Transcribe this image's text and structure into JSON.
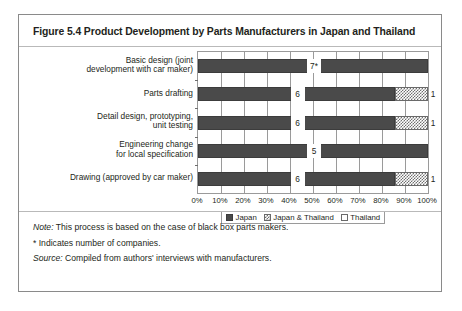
{
  "figure": {
    "title": "Figure 5.4 Product Development by Parts Manufacturers in Japan and Thailand"
  },
  "notes": {
    "note_label": "Note:",
    "note_text": " This process is based on the case of black box parts makers.",
    "asterisk_line": "* Indicates number of companies.",
    "source_label": "Source:",
    "source_text": " Compiled from authors' interviews with manufacturers."
  },
  "colors": {
    "japan": "#4a4a4a",
    "both": "#6f6f6f",
    "thailand": "#ffffff",
    "frame": "#8a8a8a",
    "grid": "#9a9a9a"
  },
  "chart_data": {
    "type": "bar",
    "orientation": "horizontal",
    "stacked": true,
    "stacked_percent": true,
    "title": "Figure 5.4 Product Development by Parts Manufacturers in Japan and Thailand",
    "xlabel": "",
    "ylabel": "",
    "xlim": [
      0,
      100
    ],
    "xticks": [
      0,
      10,
      20,
      30,
      40,
      50,
      60,
      70,
      80,
      90,
      100
    ],
    "xtick_labels": [
      "0%",
      "10%",
      "20%",
      "30%",
      "40%",
      "50%",
      "60%",
      "70%",
      "80%",
      "90%",
      "100%"
    ],
    "grid": true,
    "legend_position": "bottom",
    "categories": [
      "Basic design (joint\ndevelopment with car maker)",
      "Parts drafting",
      "Detail design, prototyping,\nunit testing",
      "Engineering change\nfor local specification",
      "Drawing (approved by car maker)"
    ],
    "series": [
      {
        "name": "Japan",
        "values": [
          100,
          85.7,
          85.7,
          100,
          85.7
        ],
        "counts": [
          7,
          6,
          6,
          5,
          6
        ],
        "labels": [
          "7*",
          "6",
          "6",
          "5",
          "6"
        ]
      },
      {
        "name": "Japan & Thailand",
        "values": [
          0,
          14.3,
          14.3,
          0,
          14.3
        ],
        "counts": [
          0,
          1,
          1,
          0,
          1
        ],
        "labels": [
          "",
          "1",
          "1",
          "",
          "1"
        ]
      },
      {
        "name": "Thailand",
        "values": [
          0,
          0,
          0,
          0,
          0
        ],
        "counts": [
          0,
          0,
          0,
          0,
          0
        ],
        "labels": [
          "",
          "",
          "",
          "",
          ""
        ]
      }
    ],
    "legend": [
      "Japan",
      "Japan & Thailand",
      "Thailand"
    ],
    "value_unit": "number of companies"
  }
}
